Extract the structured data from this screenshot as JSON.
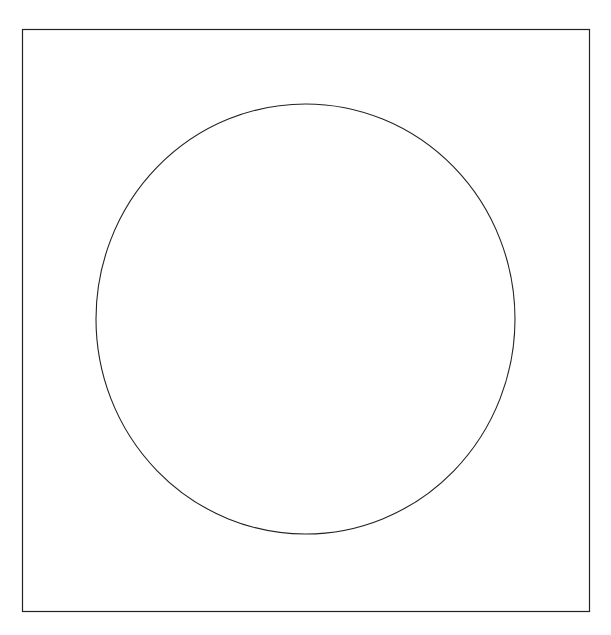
{
  "diagram": {
    "background": "#ffffff",
    "stroke_color": "#222222",
    "frame": {
      "shape": "rectangle",
      "x": 22.5,
      "y": 29.5,
      "width": 567,
      "height": 582,
      "stroke_width": 1.2
    },
    "shape": {
      "type": "ellipse",
      "cx": 305.5,
      "cy": 319,
      "rx": 209.5,
      "ry": 215,
      "stroke_width": 1.1
    }
  }
}
